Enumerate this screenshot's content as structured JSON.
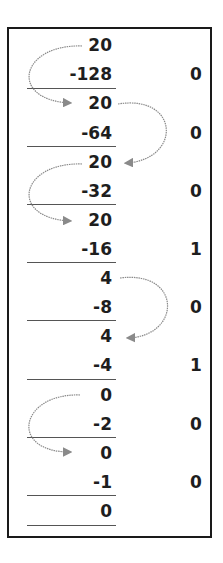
{
  "diagram": {
    "rows": [
      {
        "value": "20",
        "bit": ""
      },
      {
        "value": "-128",
        "bit": "0"
      },
      {
        "value": "20",
        "bit": ""
      },
      {
        "value": "-64",
        "bit": "0"
      },
      {
        "value": "20",
        "bit": ""
      },
      {
        "value": "-32",
        "bit": "0"
      },
      {
        "value": "20",
        "bit": ""
      },
      {
        "value": "-16",
        "bit": "1"
      },
      {
        "value": "4",
        "bit": ""
      },
      {
        "value": "-8",
        "bit": "0"
      },
      {
        "value": "4",
        "bit": ""
      },
      {
        "value": "-4",
        "bit": "1"
      },
      {
        "value": "0",
        "bit": ""
      },
      {
        "value": "-2",
        "bit": "0"
      },
      {
        "value": "0",
        "bit": ""
      },
      {
        "value": "-1",
        "bit": "0"
      },
      {
        "value": "0",
        "bit": ""
      }
    ],
    "colors": {
      "text": "#1e1e1e",
      "border": "#1a1a1a",
      "arrow": "#8a8a8a",
      "underline": "#555555"
    }
  }
}
